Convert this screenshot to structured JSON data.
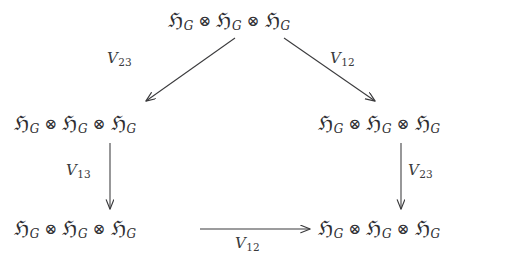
{
  "diagram": {
    "type": "commutative-diagram",
    "background_color": "#ffffff",
    "ink_color": "#3a3a3c",
    "object_label": {
      "frak": "ℌ",
      "subscript": "G",
      "tensor": "⊗",
      "full_text": "ℌ_G ⊗ ℌ_G ⊗ ℌ_G"
    },
    "nodes": [
      {
        "id": "top",
        "text": "ℌ_G ⊗ ℌ_G ⊗ ℌ_G",
        "position": "top-center"
      },
      {
        "id": "mid-left",
        "text": "ℌ_G ⊗ ℌ_G ⊗ ℌ_G",
        "position": "middle-left"
      },
      {
        "id": "mid-right",
        "text": "ℌ_G ⊗ ℌ_G ⊗ ℌ_G",
        "position": "middle-right"
      },
      {
        "id": "bot-left",
        "text": "ℌ_G ⊗ ℌ_G ⊗ ℌ_G",
        "position": "bottom-left"
      },
      {
        "id": "bot-right",
        "text": "ℌ_G ⊗ ℌ_G ⊗ ℌ_G",
        "position": "bottom-right"
      }
    ],
    "arrows": [
      {
        "id": "diag-left",
        "from": "top",
        "to": "mid-left",
        "label": "V",
        "label_sub": "23",
        "direction": "down-left"
      },
      {
        "id": "diag-right",
        "from": "top",
        "to": "mid-right",
        "label": "V",
        "label_sub": "12",
        "direction": "down-right"
      },
      {
        "id": "vert-left",
        "from": "mid-left",
        "to": "bot-left",
        "label": "V",
        "label_sub": "13",
        "direction": "down"
      },
      {
        "id": "vert-right",
        "from": "mid-right",
        "to": "bot-right",
        "label": "V",
        "label_sub": "23",
        "direction": "down"
      },
      {
        "id": "horiz",
        "from": "bot-left",
        "to": "bot-right",
        "label": "V",
        "label_sub": "12",
        "direction": "right"
      }
    ]
  }
}
